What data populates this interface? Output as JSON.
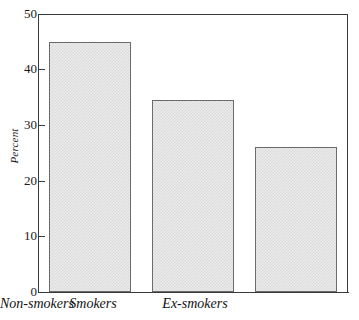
{
  "chart_data": {
    "type": "bar",
    "title": "",
    "xlabel": "",
    "ylabel": "Percent",
    "categories": [
      "Smokers",
      "Ex-smokers",
      "Non-smokers"
    ],
    "values": [
      45,
      34.5,
      26
    ],
    "ylim": [
      0,
      50
    ],
    "yticks": [
      0,
      10,
      20,
      30,
      40,
      50
    ],
    "ytick_labels": [
      "0",
      "10",
      "20",
      "30",
      "40",
      "50"
    ],
    "grid": false,
    "legend": null,
    "bar_fill_color": "#ececec",
    "bar_edge_color": "#6b6b6b",
    "axis_color": "#3a3a3a",
    "background_color": "#ffffff"
  }
}
